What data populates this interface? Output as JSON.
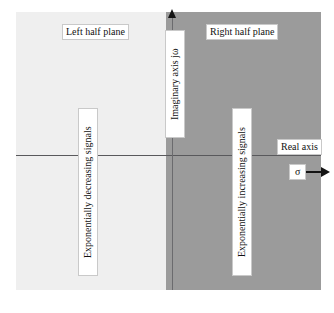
{
  "figure": {
    "colors": {
      "left_half_plane_fill": "#efefef",
      "right_half_plane_fill": "#9b9b9b",
      "axis_line": "#59595c",
      "arrow": "#141414",
      "label_background": "#ffffff",
      "label_text": "#111111"
    }
  },
  "labels": {
    "left_half_plane": "Left half plane",
    "right_half_plane": "Right half plane",
    "imaginary_axis": "Imaginary axis  jω",
    "real_axis": "Real axis",
    "exponentially_decreasing": "Exponentially decreasing signals",
    "exponentially_increasing": "Exponentially increasing signals",
    "sigma": "σ"
  },
  "chart_data": {
    "type": "diagram",
    "regions": [
      {
        "name": "Left half plane",
        "description": "Exponentially decreasing signals",
        "fill": "#efefef",
        "x_range": [
          "-inf",
          0
        ]
      },
      {
        "name": "Right half plane",
        "description": "Exponentially increasing signals",
        "fill": "#9b9b9b",
        "x_range": [
          0,
          "+inf"
        ]
      }
    ],
    "axes": [
      {
        "name": "Real axis",
        "symbol": "σ",
        "orientation": "horizontal",
        "arrow_direction": "right"
      },
      {
        "name": "Imaginary axis",
        "symbol": "jω",
        "orientation": "vertical",
        "arrow_direction": "up"
      }
    ],
    "grid": false,
    "legend": "none"
  }
}
